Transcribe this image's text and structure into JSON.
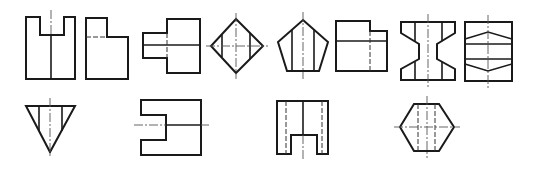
{
  "figure": {
    "type": "orthographic-views-exercise",
    "line_color": "#1a1a1a",
    "background": "#ffffff",
    "rows": [
      {
        "row": 1,
        "views": [
          {
            "id": 1,
            "name": "u-notch-view"
          },
          {
            "id": 2,
            "name": "l-step-view"
          },
          {
            "id": 3,
            "name": "stepped-shaft-view"
          },
          {
            "id": 4,
            "name": "diamond-view"
          },
          {
            "id": 5,
            "name": "pentagon-view"
          },
          {
            "id": 6,
            "name": "stepped-rectangle-view"
          },
          {
            "id": 7,
            "name": "i-beam-view"
          },
          {
            "id": 8,
            "name": "hexagonal-section-view"
          }
        ]
      },
      {
        "row": 2,
        "views": [
          {
            "id": 9,
            "name": "inverted-triangle-view"
          },
          {
            "id": 10,
            "name": "e-slot-view"
          },
          {
            "id": 11,
            "name": "inverted-u-view"
          },
          {
            "id": 12,
            "name": "hexagon-view"
          }
        ]
      }
    ]
  }
}
